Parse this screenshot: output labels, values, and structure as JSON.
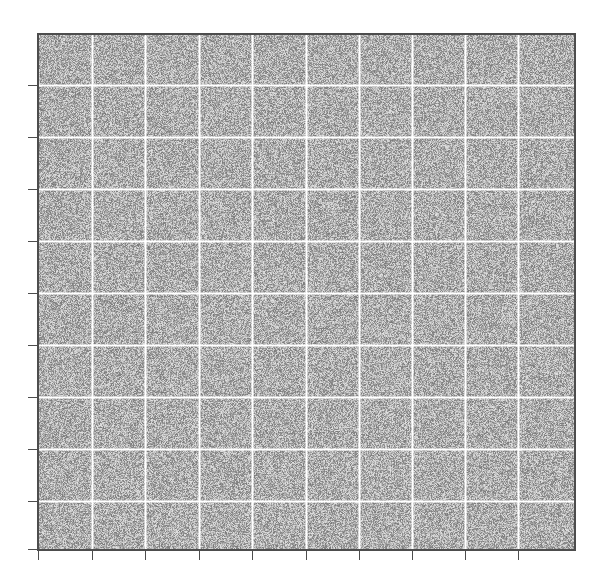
{
  "figure": {
    "background_color": "#ffffff",
    "width": 601,
    "height": 580
  },
  "chart_data": {
    "type": "heatmap",
    "title": "",
    "subtitle": "",
    "xlabel": "",
    "ylabel": "",
    "legend": [],
    "annotations": [],
    "grid": true,
    "grid_color": "#ffffff",
    "grid_linewidth": 2,
    "colormap": "gray",
    "value_range": [
      0,
      1
    ],
    "mean_gray_level": 0.68,
    "noise_type": "uniform-random",
    "pixel_grid": {
      "rows": 515,
      "cols": 537
    },
    "x_ticks": [
      0,
      1,
      2,
      3,
      4,
      5,
      6,
      7,
      8,
      9
    ],
    "x_tick_labels": [
      "",
      "",
      "",
      "",
      "",
      "",
      "",
      "",
      "",
      ""
    ],
    "x_tick_positions_px": [
      38,
      92,
      145,
      199,
      252,
      306,
      359,
      412,
      465,
      518
    ],
    "y_ticks": [
      0,
      1,
      2,
      3,
      4,
      5,
      6,
      7,
      8,
      9
    ],
    "y_tick_labels": [
      "",
      "",
      "",
      "",
      "",
      "",
      "",
      "",
      "",
      ""
    ],
    "y_tick_positions_px": [
      85,
      137,
      189,
      241,
      293,
      345,
      397,
      449,
      501,
      549
    ],
    "xlim": [
      0,
      537
    ],
    "ylim": [
      515,
      0
    ],
    "gridlines_vertical_px": [
      92,
      145,
      199,
      252,
      306,
      359,
      412,
      465,
      518
    ],
    "gridlines_horizontal_px": [
      85,
      137,
      189,
      241,
      293,
      345,
      397,
      449,
      501
    ],
    "series": [
      {
        "name": "noise-image",
        "values": []
      }
    ]
  },
  "axes": {
    "spine_color": "#4d4d4d",
    "tick_color": "#4d4d4d",
    "tick_length_px": 9,
    "plot_left_px": 38,
    "plot_top_px": 34,
    "plot_width_px": 537,
    "plot_height_px": 515
  }
}
